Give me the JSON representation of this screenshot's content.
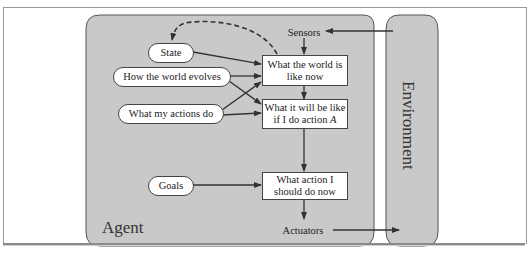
{
  "diagram": {
    "type": "goal-based agent architecture",
    "agent": {
      "label": "Agent"
    },
    "environment": {
      "label": "Environment"
    },
    "sensors": {
      "label": "Sensors"
    },
    "actuators": {
      "label": "Actuators"
    },
    "ovals": {
      "state": "State",
      "world_evolves": "How the world evolves",
      "actions_do": "What my actions do",
      "goals": "Goals"
    },
    "boxes": {
      "world_now": "What the world is like now",
      "will_be_like_prefix": "What it will be like if I do action ",
      "will_be_like_var": "A",
      "action_now": "What action I should do now"
    },
    "edges": [
      {
        "from": "Environment",
        "to": "Sensors"
      },
      {
        "from": "Sensors",
        "to": "What the world is like now"
      },
      {
        "from": "State",
        "to": "What the world is like now"
      },
      {
        "from": "How the world evolves",
        "to": "What the world is like now"
      },
      {
        "from": "How the world evolves",
        "to": "What it will be like if I do action A"
      },
      {
        "from": "What my actions do",
        "to": "What the world is like now"
      },
      {
        "from": "What my actions do",
        "to": "What it will be like if I do action A"
      },
      {
        "from": "What the world is like now",
        "to": "State",
        "style": "dashed"
      },
      {
        "from": "What the world is like now",
        "to": "What it will be like if I do action A"
      },
      {
        "from": "What it will be like if I do action A",
        "to": "What action I should do now"
      },
      {
        "from": "Goals",
        "to": "What action I should do now"
      },
      {
        "from": "What action I should do now",
        "to": "Actuators"
      },
      {
        "from": "Actuators",
        "to": "Environment"
      }
    ],
    "colors": {
      "panel": "#c8c8c8",
      "node_fill": "#ffffff",
      "stroke": "#333333"
    }
  }
}
